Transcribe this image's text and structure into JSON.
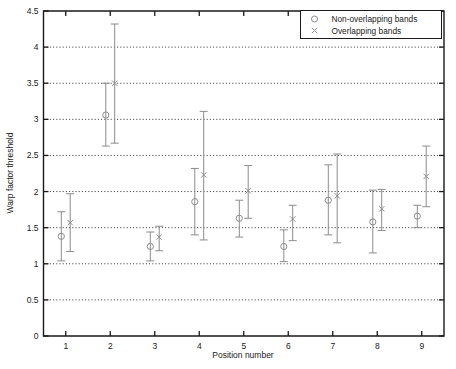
{
  "chart_data": {
    "type": "scatter",
    "title": "",
    "xlabel": "Position number",
    "ylabel": "Warp factor threshold",
    "xlim": [
      0.5,
      9.5
    ],
    "ylim": [
      0,
      4.5
    ],
    "xticks": [
      1,
      2,
      3,
      4,
      5,
      6,
      7,
      8,
      9
    ],
    "xticklabels": [
      "1",
      "2",
      "3",
      "4",
      "5",
      "6",
      "7",
      "8",
      "9"
    ],
    "yticks": [
      0,
      0.5,
      1,
      1.5,
      2,
      2.5,
      3,
      3.5,
      4,
      4.5
    ],
    "yticklabels": [
      "0",
      "0.5",
      "1",
      "1.5",
      "2",
      "2.5",
      "3",
      "3.5",
      "4",
      "4.5"
    ],
    "grid": "horizontal-dotted",
    "legend_position": "top-right",
    "categories": [
      "1",
      "2",
      "3",
      "4",
      "5",
      "6",
      "7",
      "8",
      "9"
    ],
    "series": [
      {
        "name": "Non-overlapping bands",
        "marker": "circle",
        "x_offset": -0.1,
        "values": [
          1.38,
          3.06,
          1.24,
          1.86,
          1.63,
          1.24,
          1.88,
          1.58,
          1.66
        ],
        "err_low": [
          1.04,
          2.63,
          1.04,
          1.4,
          1.37,
          1.03,
          1.4,
          1.15,
          1.5
        ],
        "err_high": [
          1.72,
          3.5,
          1.44,
          2.32,
          1.88,
          1.47,
          2.37,
          2.02,
          1.81
        ]
      },
      {
        "name": "Overlapping bands",
        "marker": "x",
        "x_offset": 0.1,
        "values": [
          1.57,
          3.5,
          1.37,
          2.23,
          2.01,
          1.62,
          1.94,
          1.76,
          2.21
        ],
        "err_low": [
          1.17,
          2.67,
          1.18,
          1.33,
          1.63,
          1.32,
          1.29,
          1.46,
          1.79
        ],
        "err_high": [
          1.97,
          4.32,
          1.52,
          3.11,
          2.36,
          1.81,
          2.52,
          2.03,
          2.63
        ]
      }
    ],
    "legend": [
      {
        "label": "Non-overlapping bands",
        "marker": "circle"
      },
      {
        "label": "Overlapping bands",
        "marker": "x"
      }
    ],
    "colors": {
      "axis": "#1a1a1a",
      "data": "#8c8c8c",
      "grid": "#1a1a1a",
      "background": "#ffffff"
    }
  }
}
